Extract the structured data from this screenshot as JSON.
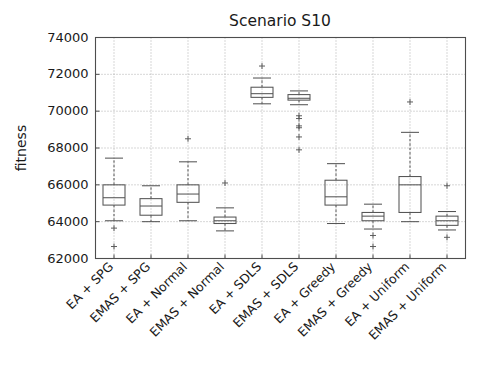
{
  "chart_data": {
    "type": "box",
    "title": "Scenario S10",
    "xlabel": "",
    "ylabel": "fitness",
    "ylim": [
      62000,
      74000
    ],
    "yticks": [
      62000,
      64000,
      66000,
      68000,
      70000,
      72000,
      74000
    ],
    "ytick_labels": [
      "62000",
      "64000",
      "66000",
      "68000",
      "70000",
      "72000",
      "74000"
    ],
    "grid": true,
    "legend": "none",
    "categories": [
      "EA + SPG",
      "EMAS + SPG",
      "EA + Normal",
      "EMAS + Normal",
      "EA + SDLS",
      "EMAS + SDLS",
      "EA + Greedy",
      "EMAS + Greedy",
      "EA + Uniform",
      "EMAS + Uniform"
    ],
    "boxes": [
      {
        "name": "EA + SPG",
        "whisker_low": 64050,
        "q1": 64900,
        "median": 65300,
        "q3": 66000,
        "whisker_high": 67450,
        "fliers": [
          63650,
          62650
        ]
      },
      {
        "name": "EMAS + SPG",
        "whisker_low": 64000,
        "q1": 64350,
        "median": 64850,
        "q3": 65250,
        "whisker_high": 65950,
        "fliers": []
      },
      {
        "name": "EA + Normal",
        "whisker_low": 64050,
        "q1": 65050,
        "median": 65500,
        "q3": 66000,
        "whisker_high": 67250,
        "fliers": [
          68500
        ]
      },
      {
        "name": "EMAS + Normal",
        "whisker_low": 63500,
        "q1": 63900,
        "median": 64050,
        "q3": 64250,
        "whisker_high": 64750,
        "fliers": [
          66100
        ]
      },
      {
        "name": "EA + SDLS",
        "whisker_low": 70400,
        "q1": 70750,
        "median": 70950,
        "q3": 71300,
        "whisker_high": 71800,
        "fliers": [
          72450
        ]
      },
      {
        "name": "EMAS + SDLS",
        "whisker_low": 70350,
        "q1": 70600,
        "median": 70700,
        "q3": 70900,
        "whisker_high": 71100,
        "fliers": [
          69750,
          69600,
          69200,
          69100,
          68600,
          67900
        ]
      },
      {
        "name": "EA + Greedy",
        "whisker_low": 63900,
        "q1": 64900,
        "median": 65350,
        "q3": 66250,
        "whisker_high": 67150,
        "fliers": []
      },
      {
        "name": "EMAS + Greedy",
        "whisker_low": 63600,
        "q1": 64050,
        "median": 64300,
        "q3": 64500,
        "whisker_high": 64950,
        "fliers": [
          63250,
          62650
        ]
      },
      {
        "name": "EA + Uniform",
        "whisker_low": 64000,
        "q1": 64500,
        "median": 66000,
        "q3": 66450,
        "whisker_high": 68850,
        "fliers": [
          70500
        ]
      },
      {
        "name": "EMAS + Uniform",
        "whisker_low": 63550,
        "q1": 63800,
        "median": 64050,
        "q3": 64300,
        "whisker_high": 64550,
        "fliers": [
          65950,
          63150
        ]
      }
    ],
    "colors": {
      "box_stroke": "#555555",
      "grid": "#9a9a9a",
      "axis": "#4d4d4d",
      "text": "#1a1a1a",
      "background": "#ffffff"
    }
  }
}
